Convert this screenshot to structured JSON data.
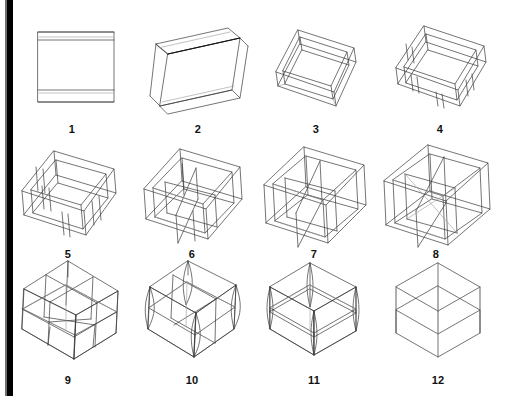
{
  "plate": {
    "title": "Wireframe box rotation series",
    "background_color": "#ffffff",
    "ink_color": "#3a3a3a",
    "label_color": "#111111",
    "gutter_color": "#000000",
    "columns": 4,
    "rows": 3,
    "figure_count": 12
  },
  "figures": [
    {
      "label": "1",
      "name": "figure-1-box-edge-on",
      "description": "Rectangular box seen exactly edge-on; appears as a flat rectangle with a thin top band and thin bottom band",
      "tilt_degrees": 0,
      "yaw_degrees": 0,
      "depth_visible": false
    },
    {
      "label": "2",
      "name": "figure-2-box-slight-tilt",
      "description": "Box tilted slightly; narrow top face and narrow bottom face become visible, whole form rotated clockwise",
      "tilt_degrees": 10,
      "yaw_degrees": 8,
      "depth_visible": true
    },
    {
      "label": "3",
      "name": "figure-3-open-tray-shallow",
      "description": "Shallow open tray viewed from above at a moderate angle; rim and inner walls visible",
      "tilt_degrees": 30,
      "yaw_degrees": 35,
      "depth_visible": true
    },
    {
      "label": "4",
      "name": "figure-4-open-tray-with-wall-edges",
      "description": "Shallow open tray with vertical corner and divider edges marked on the inner walls",
      "tilt_degrees": 35,
      "yaw_degrees": 35,
      "depth_visible": true
    },
    {
      "label": "5",
      "name": "figure-5-tray-deeper",
      "description": "Deeper open tray, four inner vertical divider edges visible against the walls",
      "tilt_degrees": 38,
      "yaw_degrees": 35,
      "depth_visible": true
    },
    {
      "label": "6",
      "name": "figure-6-box-with-dividers",
      "description": "Open box with internal partitions forming compartments, seen from above-front",
      "tilt_degrees": 42,
      "yaw_degrees": 35,
      "depth_visible": true
    },
    {
      "label": "7",
      "name": "figure-7-box-tall-dividers",
      "description": "Taller open box; partitions extend upward and cross the interior",
      "tilt_degrees": 46,
      "yaw_degrees": 35,
      "depth_visible": true
    },
    {
      "label": "8",
      "name": "figure-8-box-crossing-dividers",
      "description": "Open box with partitions crossing each other; transparent wireframe overlap visible",
      "tilt_degrees": 50,
      "yaw_degrees": 35,
      "depth_visible": true
    },
    {
      "label": "9",
      "name": "figure-9-cube-subdivided",
      "description": "Near-cubic wireframe viewed three-quarter, subdivided by internal planes into eight cells",
      "tilt_degrees": 55,
      "yaw_degrees": 35,
      "depth_visible": true
    },
    {
      "label": "10",
      "name": "figure-10-cube-rotated",
      "description": "Cube rotated further; vertical edges read as thin lens shapes where near and far edges nearly coincide",
      "tilt_degrees": 60,
      "yaw_degrees": 28,
      "depth_visible": true
    },
    {
      "label": "11",
      "name": "figure-11-cube-near-isometric",
      "description": "Cube approaching isometric; horizontal mid-plane visible, vertical edges doubled into narrow slivers",
      "tilt_degrees": 65,
      "yaw_degrees": 20,
      "depth_visible": true
    },
    {
      "label": "12",
      "name": "figure-12-cube-isometric",
      "description": "Cube in full isometric projection; hexagonal silhouette with a horizontal mid-plane and central vertical axis",
      "tilt_degrees": 70,
      "yaw_degrees": 0,
      "depth_visible": true
    }
  ],
  "geometry": {
    "projection": "oblique/axonometric line drawing",
    "line_weight_px": 0.7,
    "note": "Each figure is a transparent wireframe rectangular box progressively rotated from edge-on (1) to isometric (12)"
  }
}
